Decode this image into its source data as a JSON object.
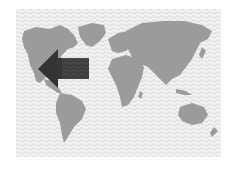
{
  "map": {
    "subject": "world-map",
    "colors": {
      "ocean_pattern_bg": "#e6e6e6",
      "ocean_pattern_line": "#f7f7f7",
      "land": "#9a9a9a",
      "arrow": "#3a3a3a",
      "arrow_tail": "#4a4a4a"
    },
    "arrow": {
      "direction": "left",
      "points_to": "west coast of North America"
    }
  }
}
